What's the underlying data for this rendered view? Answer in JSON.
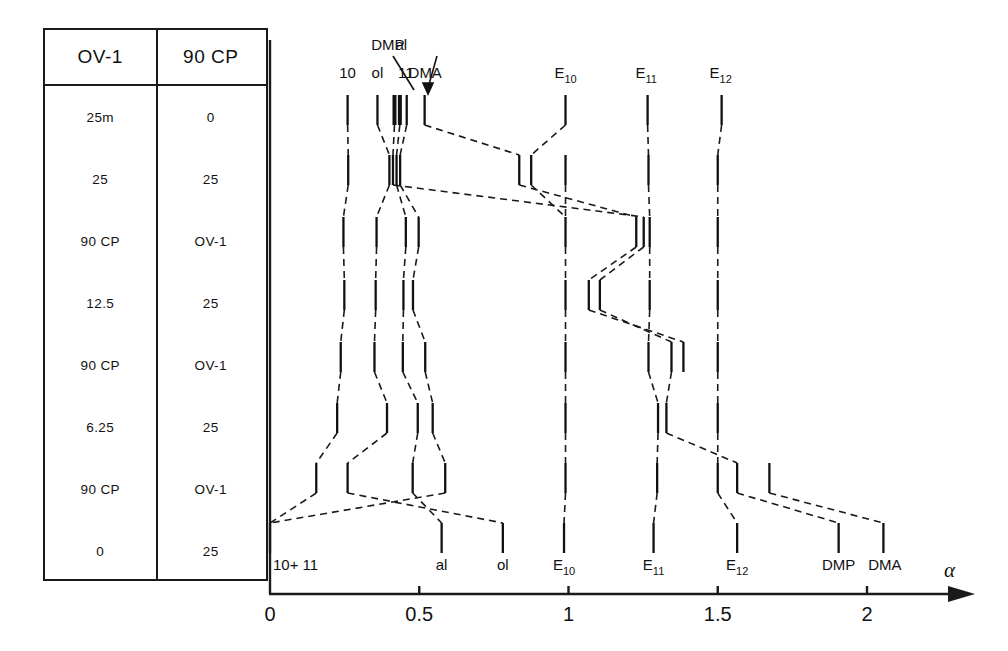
{
  "figure": {
    "axis": {
      "label": "α",
      "ticks": [
        {
          "value": 0,
          "label": "0"
        },
        {
          "value": 0.5,
          "label": "0.5"
        },
        {
          "value": 1,
          "label": "1"
        },
        {
          "value": 1.5,
          "label": "1.5"
        },
        {
          "value": 2,
          "label": "2"
        }
      ],
      "range": [
        0,
        2.45
      ]
    },
    "top_labels": [
      {
        "text": "10",
        "x": 0.26
      },
      {
        "text": "ol",
        "x": 0.36
      },
      {
        "text": "DMP",
        "x": 0.395,
        "leader": true
      },
      {
        "text": "al",
        "x": 0.44,
        "leader": true
      },
      {
        "text": "11",
        "x": 0.455
      },
      {
        "text": "DMA",
        "x": 0.52
      },
      {
        "text": "E",
        "sub": "10",
        "x": 0.99
      },
      {
        "text": "E",
        "sub": "11",
        "x": 1.26
      },
      {
        "text": "E",
        "sub": "12",
        "x": 1.51
      }
    ],
    "bottom_labels": [
      {
        "text": "10+ 11",
        "x": 0.0
      },
      {
        "text": "al",
        "x": 0.575
      },
      {
        "text": "ol",
        "x": 0.78
      },
      {
        "text": "E",
        "sub": "10",
        "x": 0.985
      },
      {
        "text": "E",
        "sub": "11",
        "x": 1.285
      },
      {
        "text": "E",
        "sub": "12",
        "x": 1.565
      },
      {
        "text": "DMP",
        "x": 1.905
      },
      {
        "text": "DMA",
        "x": 2.06
      }
    ],
    "table": {
      "headers": [
        "OV-1",
        "90 CP"
      ],
      "rows": [
        [
          "25m",
          "0"
        ],
        [
          "25",
          "25"
        ],
        [
          "90 CP",
          "OV-1"
        ],
        [
          "12.5",
          "25"
        ],
        [
          "90 CP",
          "OV-1"
        ],
        [
          "6.25",
          "25"
        ],
        [
          "90 CP",
          "OV-1"
        ],
        [
          "0",
          "25"
        ]
      ]
    }
  },
  "chart_data": {
    "type": "scatter",
    "xlabel": "α",
    "ylabel": "",
    "xlim": [
      0,
      2.45
    ],
    "xticks": [
      0,
      0.5,
      1,
      1.5,
      2
    ],
    "grid": false,
    "legend": null,
    "note": "Each horizontal band (row) corresponds to one column-pair condition in the table; marks are retention peaks plotted on the α axis, connected between rows by dashed tie-lines.",
    "rows": [
      {
        "row": 1,
        "y": 110,
        "condition": [
          "25m",
          "0"
        ],
        "peaks": [
          {
            "name": "10",
            "x": 0.26
          },
          {
            "name": "ol",
            "x": 0.36
          },
          {
            "name": "DMP",
            "x": 0.417,
            "bold": true
          },
          {
            "name": "al",
            "x": 0.435,
            "bold": true
          },
          {
            "name": "11",
            "x": 0.458
          },
          {
            "name": "DMA",
            "x": 0.518
          },
          {
            "name": "E10",
            "x": 0.99
          },
          {
            "name": "E11",
            "x": 1.265
          },
          {
            "name": "E12",
            "x": 1.513
          }
        ]
      },
      {
        "row": 2,
        "y": 170,
        "condition": [
          "25",
          "25"
        ],
        "peaks": [
          {
            "name": "10",
            "x": 0.262
          },
          {
            "name": "ol",
            "x": 0.4
          },
          {
            "name": "DMP",
            "x": 0.412
          },
          {
            "name": "al",
            "x": 0.424
          },
          {
            "name": "11",
            "x": 0.436
          },
          {
            "name": "DMA",
            "x": 0.835
          },
          {
            "name": "E10",
            "x": 0.875
          },
          {
            "name": "E10b",
            "x": 0.99
          },
          {
            "name": "E11",
            "x": 1.268
          },
          {
            "name": "E12",
            "x": 1.5
          }
        ]
      },
      {
        "row": 3,
        "y": 232,
        "condition": [
          "90 CP",
          "OV-1"
        ],
        "peaks": [
          {
            "name": "10",
            "x": 0.246
          },
          {
            "name": "ol",
            "x": 0.357
          },
          {
            "name": "al",
            "x": 0.455
          },
          {
            "name": "11",
            "x": 0.498
          },
          {
            "name": "E10",
            "x": 0.99
          },
          {
            "name": "DMA",
            "x": 1.227
          },
          {
            "name": "DMP",
            "x": 1.252
          },
          {
            "name": "E11",
            "x": 1.272
          },
          {
            "name": "E12",
            "x": 1.5
          }
        ]
      },
      {
        "row": 4,
        "y": 295,
        "condition": [
          "12.5",
          "25"
        ],
        "peaks": [
          {
            "name": "10",
            "x": 0.249
          },
          {
            "name": "ol",
            "x": 0.354
          },
          {
            "name": "al",
            "x": 0.447
          },
          {
            "name": "11",
            "x": 0.479
          },
          {
            "name": "E10",
            "x": 0.99
          },
          {
            "name": "DMA",
            "x": 1.068
          },
          {
            "name": "DMP",
            "x": 1.105
          },
          {
            "name": "E11",
            "x": 1.272
          },
          {
            "name": "E12",
            "x": 1.5
          }
        ]
      },
      {
        "row": 5,
        "y": 357,
        "condition": [
          "90 CP",
          "OV-1"
        ],
        "peaks": [
          {
            "name": "10",
            "x": 0.237
          },
          {
            "name": "ol",
            "x": 0.35
          },
          {
            "name": "al",
            "x": 0.445
          },
          {
            "name": "11",
            "x": 0.52
          },
          {
            "name": "E10",
            "x": 0.99
          },
          {
            "name": "E11",
            "x": 1.268
          },
          {
            "name": "DMP",
            "x": 1.345
          },
          {
            "name": "DMA",
            "x": 1.385
          },
          {
            "name": "E12",
            "x": 1.5
          }
        ]
      },
      {
        "row": 6,
        "y": 418,
        "condition": [
          "6.25",
          "25"
        ],
        "peaks": [
          {
            "name": "10",
            "x": 0.225
          },
          {
            "name": "ol",
            "x": 0.392
          },
          {
            "name": "al",
            "x": 0.495
          },
          {
            "name": "11",
            "x": 0.545
          },
          {
            "name": "E10",
            "x": 0.99
          },
          {
            "name": "E11",
            "x": 1.3
          },
          {
            "name": "DMP",
            "x": 1.328
          },
          {
            "name": "E12",
            "x": 1.5
          }
        ]
      },
      {
        "row": 7,
        "y": 478,
        "condition": [
          "90 CP",
          "OV-1"
        ],
        "peaks": [
          {
            "name": "10",
            "x": 0.155
          },
          {
            "name": "ol",
            "x": 0.26
          },
          {
            "name": "al",
            "x": 0.478
          },
          {
            "name": "11",
            "x": 0.587
          },
          {
            "name": "E10",
            "x": 0.99
          },
          {
            "name": "E11",
            "x": 1.297
          },
          {
            "name": "DMP",
            "x": 1.565
          },
          {
            "name": "DMA",
            "x": 1.673
          },
          {
            "name": "E12",
            "x": 1.5
          }
        ]
      },
      {
        "row": 8,
        "y": 538,
        "condition": [
          "0",
          "25"
        ],
        "peaks": [
          {
            "name": "10+11",
            "x": 0.0
          },
          {
            "name": "al",
            "x": 0.575
          },
          {
            "name": "ol",
            "x": 0.78
          },
          {
            "name": "E10",
            "x": 0.985
          },
          {
            "name": "E11",
            "x": 1.285
          },
          {
            "name": "E12",
            "x": 1.565
          },
          {
            "name": "DMP",
            "x": 1.905
          },
          {
            "name": "DMA",
            "x": 2.055
          }
        ]
      }
    ]
  }
}
